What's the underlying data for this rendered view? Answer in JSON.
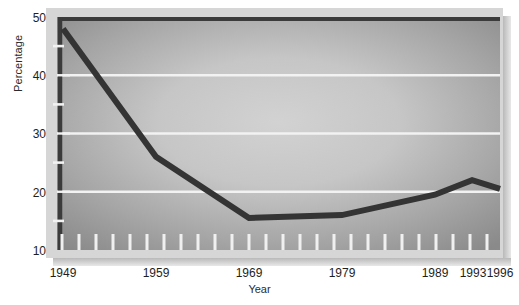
{
  "chart_data": {
    "type": "line",
    "title": "",
    "xlabel": "Year",
    "ylabel": "Percentage",
    "x": [
      1949,
      1959,
      1969,
      1979,
      1989,
      1993,
      1996
    ],
    "values": [
      48,
      26,
      15.5,
      16,
      19.5,
      22,
      20.5
    ],
    "series": [
      {
        "name": "Percentage",
        "values": [
          48,
          26,
          15.5,
          16,
          19.5,
          22,
          20.5
        ]
      }
    ],
    "xlim": [
      1949,
      1996
    ],
    "ylim": [
      10,
      50
    ],
    "y_ticks": [
      10,
      20,
      30,
      40,
      50
    ],
    "y_minor_ticks": [
      15,
      25,
      35,
      45
    ],
    "x_tick_labels": [
      "1949",
      "1959",
      "1969",
      "1979",
      "1989",
      "1993",
      "1996"
    ],
    "x_tick_values": [
      1949,
      1959,
      1969,
      1979,
      1989,
      1993,
      1996
    ],
    "grid": "horizontal-major",
    "gridline_values": [
      20,
      30,
      40
    ],
    "legend": "none",
    "line_color": "#333333",
    "gridline_color": "#ffffff",
    "plot_bg_center_color": "#cacaca",
    "plot_bg_edge_color": "#8a8a8a",
    "frame_color": "#d4d4d4",
    "axis_color": "#3a3a3a"
  },
  "axis_titles": {
    "y": "Percentage",
    "x": "Year"
  },
  "y_tick_labels": {
    "t50": "50",
    "t40": "40",
    "t30": "30",
    "t20": "20",
    "t10": "10"
  },
  "x_tick_labels": {
    "t1949": "1949",
    "t1959": "1959",
    "t1969": "1969",
    "t1979": "1979",
    "t1989": "1989",
    "t1993": "1993",
    "t1996": "1996"
  }
}
